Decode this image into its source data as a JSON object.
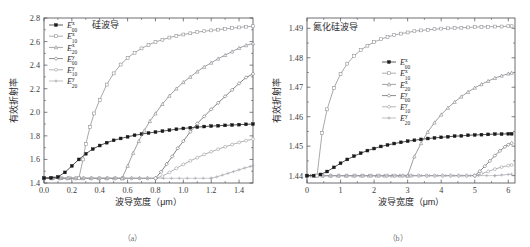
{
  "figure": {
    "top_partial_text": "",
    "panels": [
      {
        "id": "a",
        "caption": "（a）",
        "title": "硅波导",
        "xlabel": "波导宽度（μm）",
        "ylabel": "有效折射率"
      },
      {
        "id": "b",
        "caption": "（b）",
        "title": "氮化硅波导",
        "xlabel": "波导宽度（μm）",
        "ylabel": "有效折射率"
      }
    ]
  },
  "chart_data": [
    {
      "type": "line",
      "panel": "a",
      "title": "硅波导",
      "xlabel": "波导宽度（μm）",
      "ylabel": "有效折射率",
      "xlim": [
        0.0,
        1.5
      ],
      "ylim": [
        1.4,
        2.8
      ],
      "xticks": [
        "0.0",
        "0.2",
        "0.4",
        "0.6",
        "0.8",
        "1.0",
        "1.2",
        "1.4"
      ],
      "xtick_values": [
        0.0,
        0.2,
        0.4,
        0.6,
        0.8,
        1.0,
        1.2,
        1.4
      ],
      "yticks": [
        "1.4",
        "1.6",
        "1.8",
        "2.0",
        "2.2",
        "2.4",
        "2.6",
        "2.8"
      ],
      "ytick_values": [
        1.4,
        1.6,
        1.8,
        2.0,
        2.2,
        2.4,
        2.6,
        2.8
      ],
      "grid": false,
      "legend_position": "upper-left",
      "baseline": 1.44,
      "series": [
        {
          "name": "E^x_00",
          "base": "E",
          "sup": "x",
          "sub": "00",
          "color": "#1a1a1a",
          "marker": "filled-square",
          "x": [
            0.0,
            0.05,
            0.1,
            0.15,
            0.2,
            0.25,
            0.3,
            0.35,
            0.4,
            0.45,
            0.5,
            0.55,
            0.6,
            0.65,
            0.7,
            0.75,
            0.8,
            0.85,
            0.9,
            0.95,
            1.0,
            1.05,
            1.1,
            1.15,
            1.2,
            1.25,
            1.3,
            1.35,
            1.4,
            1.45,
            1.5
          ],
          "y": [
            1.442,
            1.444,
            1.452,
            1.49,
            1.545,
            1.6,
            1.648,
            1.688,
            1.718,
            1.742,
            1.762,
            1.778,
            1.792,
            1.805,
            1.815,
            1.824,
            1.832,
            1.84,
            1.848,
            1.856,
            1.863,
            1.869,
            1.874,
            1.879,
            1.883,
            1.886,
            1.889,
            1.892,
            1.895,
            1.898,
            1.9
          ]
        },
        {
          "name": "E^x_10",
          "base": "E",
          "sup": "x",
          "sub": "10",
          "color": "#8c8c92",
          "marker": "open-square",
          "cutoff": 0.25,
          "x": [
            0.25,
            0.28,
            0.3,
            0.33,
            0.36,
            0.4,
            0.45,
            0.5,
            0.55,
            0.6,
            0.65,
            0.7,
            0.75,
            0.8,
            0.85,
            0.9,
            0.95,
            1.0,
            1.05,
            1.1,
            1.15,
            1.2,
            1.25,
            1.3,
            1.35,
            1.4,
            1.45,
            1.5
          ],
          "y": [
            1.44,
            1.6,
            1.73,
            1.875,
            1.99,
            2.105,
            2.235,
            2.33,
            2.405,
            2.462,
            2.505,
            2.542,
            2.572,
            2.596,
            2.616,
            2.634,
            2.648,
            2.66,
            2.67,
            2.68,
            2.688,
            2.695,
            2.701,
            2.708,
            2.714,
            2.72,
            2.726,
            2.73
          ]
        },
        {
          "name": "E^x_20",
          "base": "E",
          "sup": "x",
          "sub": "20",
          "color": "#7d7d84",
          "marker": "open-triangle",
          "cutoff": 0.56,
          "x": [
            0.56,
            0.6,
            0.64,
            0.68,
            0.72,
            0.76,
            0.8,
            0.85,
            0.9,
            0.95,
            1.0,
            1.05,
            1.1,
            1.15,
            1.2,
            1.25,
            1.3,
            1.35,
            1.4,
            1.45,
            1.5
          ],
          "y": [
            1.44,
            1.545,
            1.655,
            1.755,
            1.845,
            1.925,
            1.99,
            2.07,
            2.14,
            2.2,
            2.255,
            2.3,
            2.345,
            2.385,
            2.42,
            2.455,
            2.485,
            2.515,
            2.545,
            2.568,
            2.585
          ]
        },
        {
          "name": "E^y_00",
          "base": "E",
          "sup": "y",
          "sub": "00",
          "color": "#5a5a60",
          "marker": "open-diamond",
          "cutoff": 0.8,
          "x": [
            0.8,
            0.84,
            0.88,
            0.92,
            0.96,
            1.0,
            1.05,
            1.1,
            1.15,
            1.2,
            1.25,
            1.3,
            1.35,
            1.4,
            1.45,
            1.5
          ],
          "y": [
            1.44,
            1.495,
            1.56,
            1.625,
            1.695,
            1.755,
            1.835,
            1.905,
            1.965,
            2.025,
            2.08,
            2.135,
            2.19,
            2.245,
            2.295,
            2.325
          ]
        },
        {
          "name": "E^y_10",
          "base": "E",
          "sup": "y",
          "sub": "10",
          "color": "#98989e",
          "marker": "open-circle",
          "cutoff": 0.8,
          "x": [
            0.8,
            0.85,
            0.9,
            0.95,
            1.0,
            1.05,
            1.1,
            1.15,
            1.2,
            1.25,
            1.3,
            1.35,
            1.4,
            1.45,
            1.5
          ],
          "y": [
            1.44,
            1.458,
            1.49,
            1.525,
            1.558,
            1.588,
            1.615,
            1.642,
            1.665,
            1.687,
            1.707,
            1.726,
            1.744,
            1.76,
            1.772
          ]
        },
        {
          "name": "E^y_20",
          "base": "E",
          "sup": "y",
          "sub": "20",
          "color": "#a8a8ae",
          "marker": "plus",
          "cutoff": 1.2,
          "x": [
            1.2,
            1.24,
            1.28,
            1.32,
            1.36,
            1.4,
            1.44,
            1.48,
            1.5
          ],
          "y": [
            1.44,
            1.452,
            1.467,
            1.482,
            1.497,
            1.512,
            1.527,
            1.54,
            1.547
          ]
        }
      ]
    },
    {
      "type": "line",
      "panel": "b",
      "title": "氮化硅波导",
      "xlabel": "波导宽度（μm）",
      "ylabel": "有效折射率",
      "xlim": [
        0,
        6.2
      ],
      "ylim": [
        1.4375,
        1.4935
      ],
      "xticks": [
        "0",
        "1",
        "2",
        "3",
        "4",
        "5",
        "6"
      ],
      "xtick_values": [
        0,
        1,
        2,
        3,
        4,
        5,
        6
      ],
      "yticks": [
        "1.44",
        "1.45",
        "1.46",
        "1.47",
        "1.48",
        "1.49"
      ],
      "ytick_values": [
        1.44,
        1.45,
        1.46,
        1.47,
        1.48,
        1.49
      ],
      "grid": false,
      "legend_position": "center",
      "baseline": 1.44,
      "series": [
        {
          "name": "E^x_00",
          "base": "E",
          "sup": "x",
          "sub": "00",
          "color": "#1a1a1a",
          "marker": "filled-square",
          "x": [
            0,
            0.2,
            0.4,
            0.6,
            0.8,
            1.0,
            1.2,
            1.4,
            1.6,
            1.8,
            2.0,
            2.2,
            2.4,
            2.6,
            2.8,
            3.0,
            3.2,
            3.4,
            3.6,
            3.8,
            4.0,
            4.2,
            4.4,
            4.6,
            4.8,
            5.0,
            5.2,
            5.4,
            5.6,
            5.8,
            6.0,
            6.1
          ],
          "y": [
            1.44,
            1.44,
            1.4404,
            1.4414,
            1.4428,
            1.4442,
            1.4455,
            1.4466,
            1.4476,
            1.4485,
            1.4492,
            1.4499,
            1.4504,
            1.4509,
            1.4513,
            1.4517,
            1.452,
            1.4523,
            1.4526,
            1.4528,
            1.453,
            1.4532,
            1.4534,
            1.4535,
            1.4537,
            1.4538,
            1.4539,
            1.454,
            1.4541,
            1.4541,
            1.4542,
            1.4542
          ]
        },
        {
          "name": "E^x_10",
          "base": "E",
          "sup": "x",
          "sub": "10",
          "color": "#8c8c92",
          "marker": "open-square",
          "cutoff": 0.3,
          "x": [
            0.3,
            0.45,
            0.6,
            0.8,
            1.0,
            1.2,
            1.4,
            1.6,
            1.8,
            2.0,
            2.2,
            2.4,
            2.6,
            2.8,
            3.0,
            3.2,
            3.4,
            3.6,
            3.8,
            4.0,
            4.2,
            4.4,
            4.6,
            4.8,
            5.0,
            5.2,
            5.4,
            5.6,
            5.8,
            6.0,
            6.1
          ],
          "y": [
            1.44,
            1.4545,
            1.4625,
            1.4697,
            1.4745,
            1.478,
            1.4806,
            1.4826,
            1.4841,
            1.4853,
            1.4863,
            1.4871,
            1.4877,
            1.4882,
            1.4886,
            1.489,
            1.4893,
            1.4895,
            1.4897,
            1.4899,
            1.49,
            1.4901,
            1.4902,
            1.4903,
            1.4904,
            1.4905,
            1.4905,
            1.4906,
            1.4906,
            1.4907,
            1.4907
          ]
        },
        {
          "name": "E^x_20",
          "base": "E",
          "sup": "x",
          "sub": "20",
          "color": "#7d7d84",
          "marker": "open-triangle",
          "cutoff": 3.0,
          "x": [
            3.0,
            3.2,
            3.4,
            3.6,
            3.8,
            4.0,
            4.2,
            4.4,
            4.6,
            4.8,
            5.0,
            5.2,
            5.4,
            5.6,
            5.8,
            6.0,
            6.1
          ],
          "y": [
            1.44,
            1.4465,
            1.451,
            1.4548,
            1.458,
            1.4607,
            1.463,
            1.465,
            1.4668,
            1.4684,
            1.4698,
            1.471,
            1.4721,
            1.4731,
            1.4739,
            1.4746,
            1.4749
          ]
        },
        {
          "name": "E^y_00",
          "base": "E",
          "sup": "y",
          "sub": "00",
          "color": "#5a5a60",
          "marker": "open-diamond",
          "cutoff": 5.0,
          "x": [
            5.0,
            5.15,
            5.3,
            5.45,
            5.6,
            5.75,
            5.9,
            6.0,
            6.1
          ],
          "y": [
            1.44,
            1.4415,
            1.4432,
            1.445,
            1.4468,
            1.4484,
            1.4498,
            1.4505,
            1.451
          ]
        },
        {
          "name": "E^y_10",
          "base": "E",
          "sup": "y",
          "sub": "10",
          "color": "#98989e",
          "marker": "open-circle",
          "cutoff": 5.0,
          "x": [
            5.0,
            5.2,
            5.4,
            5.6,
            5.8,
            6.0,
            6.1
          ],
          "y": [
            1.44,
            1.4406,
            1.4414,
            1.4422,
            1.4429,
            1.4434,
            1.4436
          ]
        },
        {
          "name": "E^y_20",
          "base": "E",
          "sup": "y",
          "sub": "20",
          "color": "#a8a8ae",
          "marker": "plus",
          "cutoff": 5.6,
          "x": [
            5.6,
            5.8,
            6.0,
            6.1
          ],
          "y": [
            1.44,
            1.4402,
            1.4404,
            1.4405
          ]
        }
      ]
    }
  ]
}
